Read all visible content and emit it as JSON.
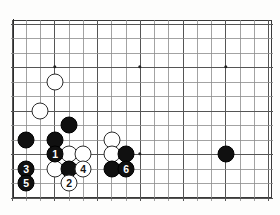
{
  "board": {
    "type": "go-board-diagram",
    "visible_columns": 18,
    "visible_rows": 12,
    "grid_origin": {
      "x": 12,
      "y": 24
    },
    "grid_spacing": {
      "x": 14.25,
      "y": 14.5
    },
    "frame_color": "#3a3a3a",
    "line_color": "#8c8c8c",
    "background_color": "#ffffff",
    "star_points": [
      {
        "x": 55,
        "y": 67
      },
      {
        "x": 140,
        "y": 67
      },
      {
        "x": 226,
        "y": 67
      },
      {
        "x": 140,
        "y": 154
      }
    ],
    "stones": [
      {
        "color": "white",
        "x": 55,
        "y": 82,
        "label": ""
      },
      {
        "color": "white",
        "x": 40,
        "y": 111,
        "label": ""
      },
      {
        "color": "black",
        "x": 69,
        "y": 125,
        "label": ""
      },
      {
        "color": "black",
        "x": 26,
        "y": 140,
        "label": ""
      },
      {
        "color": "black",
        "x": 55,
        "y": 140,
        "label": ""
      },
      {
        "color": "white",
        "x": 112,
        "y": 140,
        "label": ""
      },
      {
        "color": "black",
        "x": 55,
        "y": 154,
        "label": "1"
      },
      {
        "color": "white",
        "x": 69,
        "y": 154,
        "label": ""
      },
      {
        "color": "white",
        "x": 83,
        "y": 154,
        "label": ""
      },
      {
        "color": "white",
        "x": 112,
        "y": 154,
        "label": ""
      },
      {
        "color": "black",
        "x": 126,
        "y": 154,
        "label": ""
      },
      {
        "color": "black",
        "x": 226,
        "y": 154,
        "label": ""
      },
      {
        "color": "black",
        "x": 26,
        "y": 169,
        "label": "3"
      },
      {
        "color": "white",
        "x": 55,
        "y": 169,
        "label": ""
      },
      {
        "color": "black",
        "x": 69,
        "y": 169,
        "label": ""
      },
      {
        "color": "white",
        "x": 83,
        "y": 169,
        "label": "4"
      },
      {
        "color": "black",
        "x": 112,
        "y": 169,
        "label": ""
      },
      {
        "color": "black",
        "x": 126,
        "y": 169,
        "label": "6"
      },
      {
        "color": "black",
        "x": 26,
        "y": 183,
        "label": "5"
      },
      {
        "color": "white",
        "x": 69,
        "y": 183,
        "label": "2"
      }
    ],
    "move_sequence": [
      {
        "number": "1",
        "color": "black"
      },
      {
        "number": "2",
        "color": "white"
      },
      {
        "number": "3",
        "color": "black"
      },
      {
        "number": "4",
        "color": "white"
      },
      {
        "number": "5",
        "color": "black"
      },
      {
        "number": "6",
        "color": "black"
      }
    ]
  },
  "caption": {
    "text": ""
  }
}
